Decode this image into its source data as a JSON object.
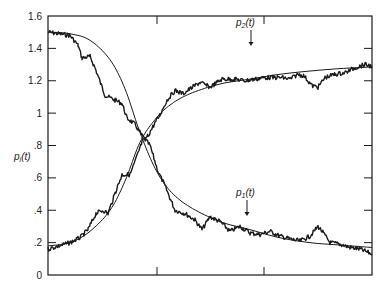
{
  "chart_data": {
    "type": "line",
    "title": "",
    "xlabel": "",
    "ylabel": "p_i(t)",
    "ylim": [
      0,
      1.6
    ],
    "y_ticks": [
      "0",
      ".2",
      ".4",
      ".6",
      ".8",
      "1",
      "1.2",
      "1.4",
      "1.6"
    ],
    "y_tick_values": [
      0,
      0.2,
      0.4,
      0.6,
      0.8,
      1.0,
      1.2,
      1.4,
      1.6
    ],
    "x_ticks_unlabeled_px": [
      157,
      264
    ],
    "grid": false,
    "legend": "none (inline annotations)",
    "annotations": [
      {
        "label": "p2(t)",
        "base": "p",
        "sub": "2",
        "suffix": "(t)",
        "x": 236,
        "y": 26,
        "arrow_x": 251,
        "arrow_from": 30,
        "arrow_to": 46
      },
      {
        "label": "p1(t)",
        "base": "p",
        "sub": "1",
        "suffix": "(t)",
        "x": 236,
        "y": 196,
        "arrow_x": 247,
        "arrow_from": 200,
        "arrow_to": 216
      }
    ],
    "series": [
      {
        "name": "p1(t) smooth",
        "style": "thin",
        "x": [
          48,
          70,
          90,
          110,
          125,
          140,
          155,
          170,
          190,
          220,
          250,
          280,
          310,
          340,
          372
        ],
        "values": [
          1.5,
          1.49,
          1.45,
          1.33,
          1.15,
          0.88,
          0.66,
          0.52,
          0.42,
          0.33,
          0.28,
          0.23,
          0.2,
          0.185,
          0.17
        ]
      },
      {
        "name": "p2(t) smooth",
        "style": "thin",
        "x": [
          48,
          70,
          90,
          110,
          125,
          140,
          155,
          170,
          190,
          220,
          250,
          280,
          310,
          340,
          372
        ],
        "values": [
          0.18,
          0.2,
          0.27,
          0.4,
          0.58,
          0.82,
          0.96,
          1.05,
          1.12,
          1.18,
          1.21,
          1.24,
          1.26,
          1.275,
          1.285
        ]
      },
      {
        "name": "p1(t) stochastic",
        "style": "noisy",
        "x": [
          48,
          70,
          78,
          82,
          90,
          95,
          105,
          115,
          122,
          127,
          135,
          142,
          150,
          158,
          165,
          175,
          185,
          195,
          202,
          210,
          220,
          230,
          240,
          250,
          260,
          270,
          280,
          292,
          300,
          310,
          318,
          322,
          330,
          340,
          350,
          360,
          372
        ],
        "values": [
          1.5,
          1.48,
          1.42,
          1.34,
          1.35,
          1.28,
          1.11,
          1.08,
          1.06,
          0.97,
          0.93,
          0.86,
          0.8,
          0.64,
          0.55,
          0.4,
          0.38,
          0.34,
          0.28,
          0.36,
          0.33,
          0.27,
          0.3,
          0.26,
          0.25,
          0.27,
          0.24,
          0.22,
          0.21,
          0.24,
          0.3,
          0.27,
          0.2,
          0.19,
          0.17,
          0.16,
          0.13
        ]
      },
      {
        "name": "p2(t) stochastic",
        "style": "noisy",
        "x": [
          48,
          70,
          80,
          88,
          96,
          103,
          108,
          116,
          122,
          130,
          135,
          142,
          148,
          155,
          160,
          167,
          175,
          183,
          190,
          200,
          210,
          222,
          235,
          245,
          255,
          265,
          275,
          282,
          290,
          298,
          304,
          312,
          318,
          325,
          335,
          345,
          355,
          365,
          372
        ],
        "values": [
          0.16,
          0.2,
          0.23,
          0.28,
          0.38,
          0.4,
          0.38,
          0.52,
          0.62,
          0.62,
          0.7,
          0.82,
          0.86,
          0.94,
          0.99,
          1.08,
          1.14,
          1.12,
          1.15,
          1.19,
          1.16,
          1.21,
          1.21,
          1.2,
          1.21,
          1.22,
          1.22,
          1.22,
          1.21,
          1.24,
          1.23,
          1.17,
          1.16,
          1.22,
          1.24,
          1.25,
          1.28,
          1.3,
          1.29
        ]
      }
    ]
  },
  "plot_area": {
    "left": 48,
    "right": 372,
    "top": 16,
    "bottom": 275
  },
  "colors": {
    "ink": "#1a1a1a",
    "background": "#ffffff"
  }
}
